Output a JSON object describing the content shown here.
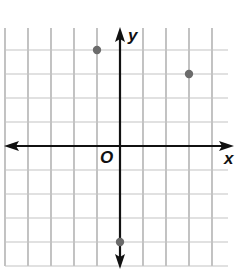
{
  "chart_data": {
    "type": "scatter",
    "title": "",
    "xlabel": "x",
    "ylabel": "y",
    "origin_label": "O",
    "grid": true,
    "xlim": [
      -5,
      5
    ],
    "ylim": [
      -5,
      5
    ],
    "tick_labels": [],
    "points": [
      {
        "x": -1,
        "y": 4
      },
      {
        "x": 3,
        "y": 3
      },
      {
        "x": 0,
        "y": -4
      }
    ]
  },
  "colors": {
    "axis": "#111111",
    "grid": "#9a9a9a",
    "point": "#6b6b6b"
  }
}
